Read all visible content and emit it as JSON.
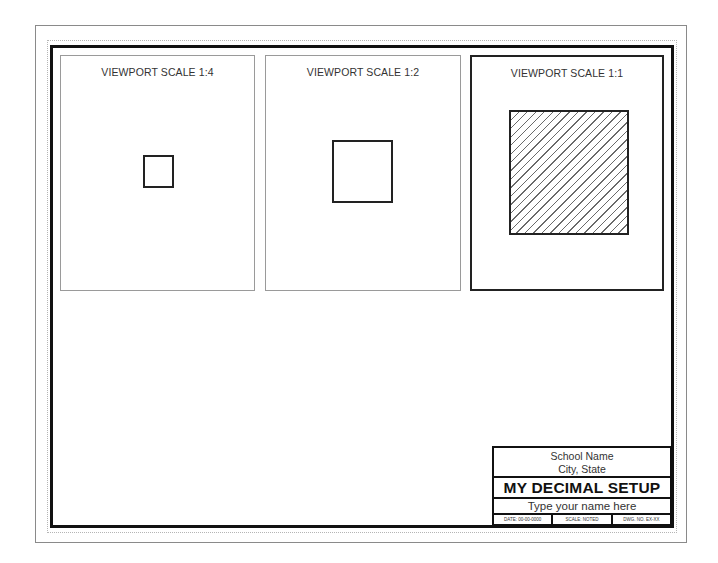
{
  "sheet": {
    "line_color": "#8a8a8a",
    "frame_color": "#111111"
  },
  "viewports": [
    {
      "label": "VIEWPORT SCALE 1:4",
      "scale": "1:4",
      "shape": "square",
      "hatched": false,
      "active": false
    },
    {
      "label": "VIEWPORT SCALE 1:2",
      "scale": "1:2",
      "shape": "square",
      "hatched": false,
      "active": false
    },
    {
      "label": "VIEWPORT SCALE 1:1",
      "scale": "1:1",
      "shape": "square",
      "hatched": true,
      "active": true
    }
  ],
  "title_block": {
    "school_name": "School Name",
    "city_state": "City, State",
    "title": "MY DECIMAL SETUP",
    "name_placeholder": "Type your name here",
    "date": "DATE: 00-00-0000",
    "scale": "SCALE: NOTED",
    "drawing_number": "DWG. NO. EX-XX"
  }
}
